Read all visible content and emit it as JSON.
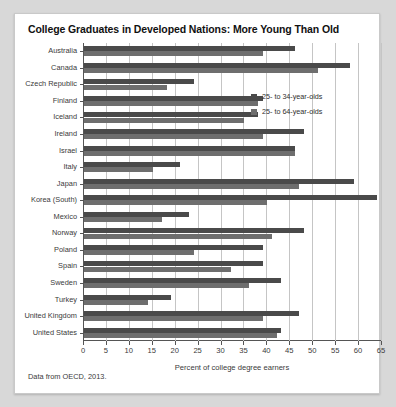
{
  "title": "College Graduates in Developed Nations: More Young Than Old",
  "source_note": "Data from OECD, 2013.",
  "legend": {
    "young_label": "25- to 34-year-olds",
    "all_label": "25- to 64-year-olds",
    "young_color": "#4a4a4a",
    "all_color": "#6e6e6e"
  },
  "chart_data": {
    "type": "bar",
    "orientation": "horizontal",
    "title": "College Graduates in Developed Nations: More Young Than Old",
    "xlabel": "Percent of college degree earners",
    "ylabel": "",
    "xlim": [
      0,
      65
    ],
    "xticks": [
      0,
      5,
      10,
      15,
      20,
      25,
      30,
      35,
      40,
      45,
      50,
      55,
      60,
      65
    ],
    "grid": true,
    "legend_position": "upper right",
    "categories": [
      "Australia",
      "Canada",
      "Czech Republic",
      "Finland",
      "Iceland",
      "Ireland",
      "Israel",
      "Italy",
      "Japan",
      "Korea (South)",
      "Mexico",
      "Norway",
      "Poland",
      "Spain",
      "Sweden",
      "Turkey",
      "United Kingdom",
      "United States"
    ],
    "series": [
      {
        "name": "25- to 34-year-olds",
        "color": "#4a4a4a",
        "values": [
          46,
          58,
          24,
          39,
          38,
          48,
          46,
          21,
          59,
          64,
          23,
          48,
          39,
          39,
          43,
          19,
          47,
          43
        ]
      },
      {
        "name": "25- to 64-year-olds",
        "color": "#6e6e6e",
        "values": [
          39,
          51,
          18,
          38,
          35,
          39,
          46,
          15,
          47,
          40,
          17,
          41,
          24,
          32,
          36,
          14,
          39,
          42
        ]
      }
    ],
    "source": "Data from OECD, 2013."
  }
}
